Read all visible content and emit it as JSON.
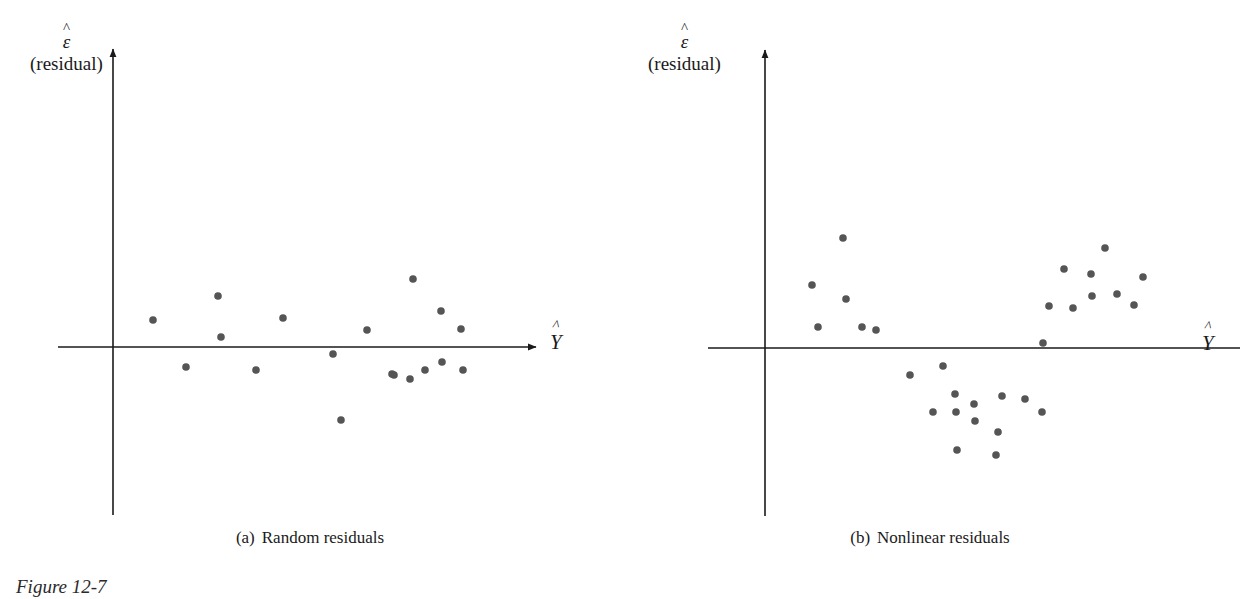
{
  "figure": {
    "number_label": "Figure 12-7",
    "dot_color": "#555555",
    "axis_color": "#1a1a1a"
  },
  "panels": [
    {
      "id": "a",
      "caption_tag": "(a)",
      "caption_text": "Random residuals",
      "y_axis": {
        "symbol": "ε",
        "hat": "^",
        "sublabel": "(residual)"
      },
      "x_axis": {
        "symbol": "Y",
        "hat": "^"
      }
    },
    {
      "id": "b",
      "caption_tag": "(b)",
      "caption_text": "Nonlinear residuals",
      "y_axis": {
        "symbol": "ε",
        "hat": "^",
        "sublabel": "(residual)"
      },
      "x_axis": {
        "symbol": "Y",
        "hat": "^"
      }
    }
  ],
  "chart_data": [
    {
      "type": "scatter",
      "title": "(a) Random residuals",
      "xlabel": "Y-hat (fitted value)",
      "ylabel": "epsilon-hat (residual)",
      "grid": false,
      "legend": "none",
      "axis_origin_px": {
        "x": 113,
        "y": 347
      },
      "axis_extent_px": {
        "x_min": 58,
        "x_max": 540,
        "y_top": 45,
        "y_bottom": 515
      },
      "points_px": [
        {
          "x": 153,
          "y": 320
        },
        {
          "x": 186,
          "y": 367
        },
        {
          "x": 218,
          "y": 296
        },
        {
          "x": 221,
          "y": 337
        },
        {
          "x": 256,
          "y": 370
        },
        {
          "x": 283,
          "y": 318
        },
        {
          "x": 333,
          "y": 354
        },
        {
          "x": 341,
          "y": 420
        },
        {
          "x": 367,
          "y": 330
        },
        {
          "x": 392,
          "y": 374
        },
        {
          "x": 394,
          "y": 375
        },
        {
          "x": 410,
          "y": 379
        },
        {
          "x": 413,
          "y": 279
        },
        {
          "x": 425,
          "y": 370
        },
        {
          "x": 441,
          "y": 311
        },
        {
          "x": 442,
          "y": 362
        },
        {
          "x": 461,
          "y": 329
        },
        {
          "x": 463,
          "y": 370
        }
      ],
      "pattern": "random scatter about zero with no systematic trend"
    },
    {
      "type": "scatter",
      "title": "(b) Nonlinear residuals",
      "xlabel": "Y-hat (fitted value)",
      "ylabel": "epsilon-hat (residual)",
      "grid": false,
      "legend": "none",
      "axis_origin_px": {
        "x": 765,
        "y": 348
      },
      "axis_extent_px": {
        "x_min": 708,
        "x_max": 1188,
        "y_top": 46,
        "y_bottom": 516
      },
      "points_px": [
        {
          "x": 812,
          "y": 285
        },
        {
          "x": 818,
          "y": 327
        },
        {
          "x": 843,
          "y": 238
        },
        {
          "x": 846,
          "y": 299
        },
        {
          "x": 862,
          "y": 327
        },
        {
          "x": 876,
          "y": 330
        },
        {
          "x": 910,
          "y": 375
        },
        {
          "x": 933,
          "y": 412
        },
        {
          "x": 943,
          "y": 366
        },
        {
          "x": 955,
          "y": 394
        },
        {
          "x": 956,
          "y": 412
        },
        {
          "x": 957,
          "y": 450
        },
        {
          "x": 974,
          "y": 404
        },
        {
          "x": 975,
          "y": 421
        },
        {
          "x": 996,
          "y": 455
        },
        {
          "x": 998,
          "y": 432
        },
        {
          "x": 1002,
          "y": 396
        },
        {
          "x": 1025,
          "y": 399
        },
        {
          "x": 1042,
          "y": 412
        },
        {
          "x": 1043,
          "y": 343
        },
        {
          "x": 1049,
          "y": 306
        },
        {
          "x": 1064,
          "y": 269
        },
        {
          "x": 1073,
          "y": 308
        },
        {
          "x": 1091,
          "y": 274
        },
        {
          "x": 1092,
          "y": 296
        },
        {
          "x": 1105,
          "y": 248
        },
        {
          "x": 1117,
          "y": 294
        },
        {
          "x": 1134,
          "y": 305
        },
        {
          "x": 1143,
          "y": 277
        }
      ],
      "pattern": "U-shaped (curvilinear) residual pattern indicating nonlinearity"
    }
  ]
}
